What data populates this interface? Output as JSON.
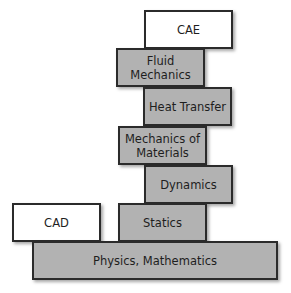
{
  "diagram": {
    "type": "stacked-blocks",
    "blocks": [
      {
        "id": "cae",
        "label": "CAE",
        "style": "white",
        "x": 144,
        "y": 10,
        "w": 89,
        "h": 39
      },
      {
        "id": "fluid-mechanics",
        "label": "Fluid\nMechanics",
        "style": "gray",
        "x": 116,
        "y": 48,
        "w": 89,
        "h": 39
      },
      {
        "id": "heat-transfer",
        "label": "Heat Transfer",
        "style": "gray",
        "x": 143,
        "y": 87,
        "w": 89,
        "h": 39
      },
      {
        "id": "mechanics-of-materials",
        "label": "Mechanics of\nMaterials",
        "style": "gray",
        "x": 118,
        "y": 126,
        "w": 89,
        "h": 39
      },
      {
        "id": "dynamics",
        "label": "Dynamics",
        "style": "gray",
        "x": 144,
        "y": 165,
        "w": 89,
        "h": 39
      },
      {
        "id": "cad",
        "label": "CAD",
        "style": "white",
        "x": 12,
        "y": 203,
        "w": 89,
        "h": 39
      },
      {
        "id": "statics",
        "label": "Statics",
        "style": "gray",
        "x": 118,
        "y": 203,
        "w": 89,
        "h": 39
      },
      {
        "id": "physics-mathematics",
        "label": "Physics, Mathematics",
        "style": "gray",
        "x": 32,
        "y": 241,
        "w": 246,
        "h": 39
      }
    ],
    "colors": {
      "gray_fill": "#b2b2b2",
      "white_fill": "#ffffff",
      "border": "#2b2b2b",
      "text": "#1e1e1e"
    }
  }
}
